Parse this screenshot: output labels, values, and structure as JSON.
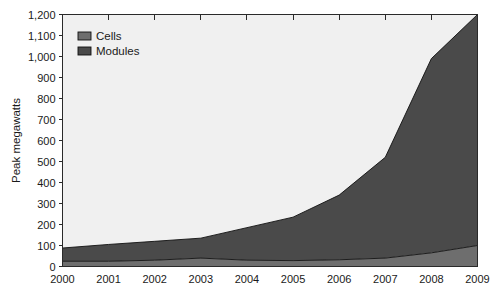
{
  "chart_data": {
    "type": "area",
    "stacked": true,
    "title": "",
    "subtitle": "",
    "xlabel": "",
    "ylabel": "Peak megawatts",
    "x": [
      2000,
      2001,
      2002,
      2003,
      2004,
      2005,
      2006,
      2007,
      2008,
      2009
    ],
    "categories": [
      "2000",
      "2001",
      "2002",
      "2003",
      "2004",
      "2005",
      "2006",
      "2007",
      "2008",
      "2009"
    ],
    "xtick_labels": [
      "2000",
      "2001",
      "2002",
      "2003",
      "2004",
      "2005",
      "2006",
      "2007",
      "2008",
      "2009"
    ],
    "ytick_labels": [
      "0",
      "100",
      "200",
      "300",
      "400",
      "500",
      "600",
      "700",
      "800",
      "900",
      "1,000",
      "1,100",
      "1,200"
    ],
    "ytick_values": [
      0,
      100,
      200,
      300,
      400,
      500,
      600,
      700,
      800,
      900,
      1000,
      1100,
      1200
    ],
    "ylim": [
      0,
      1200
    ],
    "xlim": [
      2000,
      2009
    ],
    "grid": false,
    "legend_position": "top-left-inside",
    "series": [
      {
        "name": "Cells",
        "color": "#6e6e6e",
        "values": [
          25,
          25,
          30,
          40,
          30,
          28,
          32,
          40,
          65,
          100
        ]
      },
      {
        "name": "Modules",
        "color": "#4a4a4a",
        "values": [
          63,
          80,
          90,
          95,
          155,
          207,
          308,
          480,
          925,
          1100
        ]
      }
    ],
    "totals": [
      88,
      105,
      120,
      135,
      185,
      235,
      340,
      520,
      990,
      1200
    ],
    "plot_background": "#f0f0f0",
    "page_background": "#ffffff",
    "axis_color": "#2a2a2a",
    "outline_color": "#111111"
  },
  "legend": {
    "items": [
      {
        "label": "Cells",
        "color": "#6e6e6e"
      },
      {
        "label": "Modules",
        "color": "#4a4a4a"
      }
    ]
  }
}
